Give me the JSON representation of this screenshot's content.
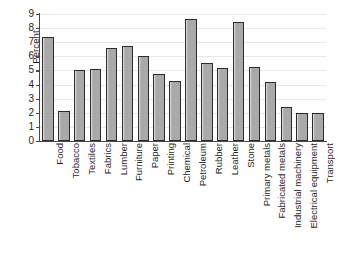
{
  "chart_data": {
    "type": "bar",
    "title": "",
    "xlabel": "",
    "ylabel": "Percent",
    "ylim": [
      0,
      9
    ],
    "yticks": [
      0,
      1,
      2,
      3,
      4,
      5,
      6,
      7,
      8,
      9
    ],
    "ytick_labels": [
      "0",
      "1",
      "2",
      "3",
      "4",
      "5",
      "6",
      "7",
      "8",
      "9"
    ],
    "grid": true,
    "legend": false,
    "categories": [
      "Food",
      "Tobacco",
      "Textiles",
      "Fabrics",
      "Lumber",
      "Furniture",
      "Paper",
      "Printing",
      "Chemical",
      "Petroleum",
      "Rubber",
      "Leather",
      "Stone",
      "Primary metals",
      "Fabricated metals",
      "Industrial machinery",
      "Electrical equipment",
      "Transport"
    ],
    "values": [
      7.4,
      2.1,
      5.05,
      5.1,
      6.6,
      6.75,
      6.0,
      4.75,
      4.25,
      8.65,
      5.55,
      5.2,
      8.4,
      5.25,
      4.2,
      2.4,
      2.0,
      2.0
    ],
    "colors": {
      "bar_fill": "#a9a9a9",
      "bar_edge": "#2b2b2b",
      "gridline": "#e9e9e9",
      "axis": "#4a4a4a",
      "background": "#ffffff",
      "text": "#1f1f1f"
    }
  }
}
